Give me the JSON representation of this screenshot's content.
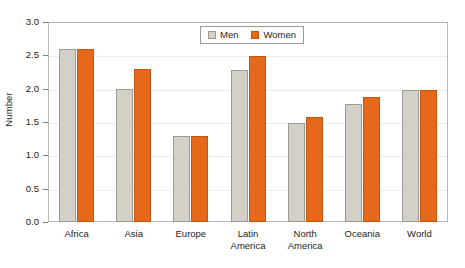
{
  "chart_data": {
    "type": "bar",
    "title": "",
    "xlabel": "",
    "ylabel": "Number",
    "ylim": [
      0.0,
      3.0
    ],
    "ytick_labels": [
      "0.0",
      "0.5",
      "1.0",
      "1.5",
      "2.0",
      "2.5",
      "3.0"
    ],
    "ytick_values": [
      0.0,
      0.5,
      1.0,
      1.5,
      2.0,
      2.5,
      3.0
    ],
    "grid": true,
    "legend_position": "top-center",
    "categories": [
      "Africa",
      "Asia",
      "Europe",
      "Latin America",
      "North America",
      "Oceania",
      "World"
    ],
    "category_lines": [
      [
        "Africa",
        ""
      ],
      [
        "Asia",
        ""
      ],
      [
        "Europe",
        ""
      ],
      [
        "Latin",
        "America"
      ],
      [
        "North",
        "America"
      ],
      [
        "Oceania",
        ""
      ],
      [
        "World",
        ""
      ]
    ],
    "series": [
      {
        "name": "Men",
        "color": "#d3d0c7",
        "values": [
          2.6,
          2.0,
          1.29,
          2.28,
          1.48,
          1.77,
          1.98
        ]
      },
      {
        "name": "Women",
        "color": "#e6681a",
        "values": [
          2.6,
          2.3,
          1.29,
          2.49,
          1.57,
          1.87,
          1.98
        ]
      }
    ]
  },
  "legend": {
    "entries": [
      {
        "label": "Men"
      },
      {
        "label": "Women"
      }
    ]
  }
}
